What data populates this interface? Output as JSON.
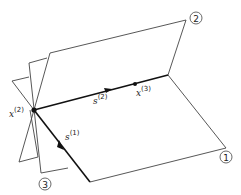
{
  "diagram": {
    "type": "geometric illustration",
    "plane_labels": [
      {
        "id": "plane-1",
        "text": "1"
      },
      {
        "id": "plane-2",
        "text": "2"
      },
      {
        "id": "plane-3",
        "text": "3"
      }
    ],
    "points": [
      {
        "id": "x2",
        "base": "x",
        "sup": "(2)"
      },
      {
        "id": "x3",
        "base": "x",
        "sup": "(3)"
      }
    ],
    "vectors": [
      {
        "id": "s1",
        "base": "s",
        "sup": "(1)"
      },
      {
        "id": "s2",
        "base": "s",
        "sup": "(2)"
      }
    ],
    "colors": {
      "line": "#333333",
      "background": "#ffffff"
    }
  }
}
